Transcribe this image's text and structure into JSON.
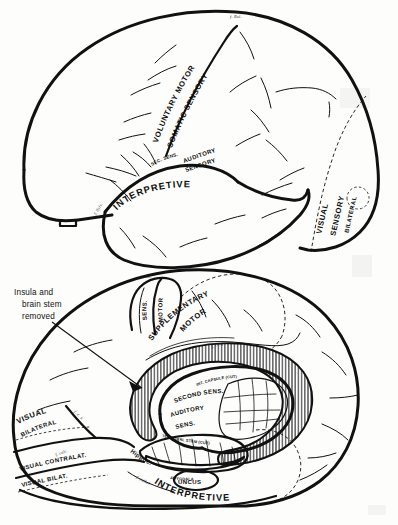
{
  "figure": {
    "background_color": "#fdfdfc",
    "ink_color": "#111111",
    "panels": [
      {
        "id": "lateral-view",
        "name": "lateral-surface-view",
        "labels": {
          "voluntary_motor": "VOLUNTARY MOTOR",
          "somatic_sensory": "SOMATIC SENSORY",
          "sec_sens": "SEC. SENS.",
          "auditory": "AUDITORY",
          "sensory": "SENSORY",
          "interpretive": "INTERPRETIVE",
          "visual": "VISUAL",
          "sensory_v": "SENSORY",
          "bilateral": "BILATERAL",
          "f_rol": "f. Rol.",
          "f_sylv": "f. Sylv."
        }
      },
      {
        "id": "medial-view",
        "name": "medial-surface-view",
        "callout": {
          "line1": "Insula and",
          "line2": "brain stem",
          "line3": "removed"
        },
        "labels": {
          "sens": "SENS.",
          "motor": "MOTOR",
          "supplementary": "SUPPLEMENTARY",
          "motor2": "MOTOR",
          "second_sens": "SECOND SENS.",
          "auditory_sens_1": "AUDITORY",
          "auditory_sens_2": "SENS.",
          "int_capsule": "INT. CAPSULE (CUT)",
          "temporal_stem": "TEMPORAL STEM (CUT)",
          "visual_bilateral_1": "VISUAL",
          "visual_bilateral_2": "BILATERAL",
          "visual_contralat": "VISUAL CONTRALAT.",
          "visual_bilat": "VISUAL BILAT.",
          "hippoc": "Hippoc.",
          "uncus": "UNCUS",
          "amygdala": "AMYGDALA",
          "interpretive": "INTERPRETIVE",
          "f_rol": "f. Rol.",
          "f_cing": "f. cing",
          "f_calc": "f. calc.",
          "f_c_s": "f. c. s.",
          "f_collat": "f. collat."
        }
      }
    ]
  }
}
